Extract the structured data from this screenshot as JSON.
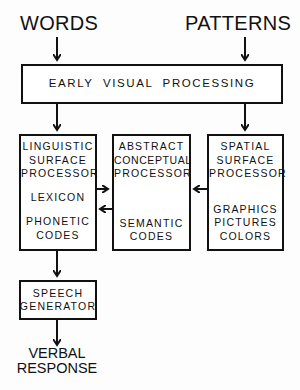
{
  "inputs": {
    "left": "WORDS",
    "right": "PATTERNS"
  },
  "early": {
    "label": "EARLY  VISUAL  PROCESSING"
  },
  "linguistic": {
    "title": [
      "LINGUISTIC",
      "SURFACE",
      "PROCESSOR"
    ],
    "item1": "LEXICON",
    "item2": [
      "PHONETIC",
      "CODES"
    ]
  },
  "abstract": {
    "title": [
      "ABSTRACT",
      "CONCEPTUAL",
      "PROCESSOR"
    ],
    "item": [
      "SEMANTIC",
      "CODES"
    ]
  },
  "spatial": {
    "title": [
      "SPATIAL",
      "SURFACE",
      "PROCESSOR"
    ],
    "items": [
      "GRAPHICS",
      "PICTURES",
      "COLORS"
    ]
  },
  "speech": {
    "label": [
      "SPEECH",
      "GENERATOR"
    ]
  },
  "output": {
    "label": [
      "VERBAL",
      "RESPONSE"
    ]
  }
}
